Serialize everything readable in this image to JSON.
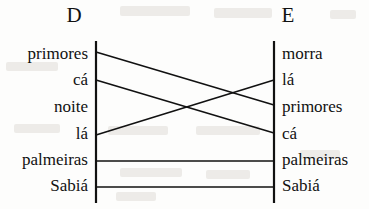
{
  "diagram": {
    "type": "bipartite-alignment",
    "column_headers": {
      "left": "D",
      "right": "E"
    },
    "left_items": [
      {
        "label": "primores",
        "y": 57
      },
      {
        "label": "cá",
        "y": 83
      },
      {
        "label": "noite",
        "y": 110
      },
      {
        "label": "lá",
        "y": 137
      },
      {
        "label": "palmeiras",
        "y": 163
      },
      {
        "label": "Sabiá",
        "y": 189
      }
    ],
    "right_items": [
      {
        "label": "morra",
        "y": 57
      },
      {
        "label": "lá",
        "y": 83
      },
      {
        "label": "primores",
        "y": 110
      },
      {
        "label": "cá",
        "y": 137
      },
      {
        "label": "palmeiras",
        "y": 163
      },
      {
        "label": "Sabiá",
        "y": 189
      }
    ],
    "connections": [
      {
        "from": "primores",
        "to": "primores",
        "y1": 52,
        "y2": 105
      },
      {
        "from": "cá",
        "to": "cá",
        "y1": 80,
        "y2": 133
      },
      {
        "from": "lá",
        "to": "lá",
        "y1": 135,
        "y2": 80
      },
      {
        "from": "palmeiras",
        "to": "palmeiras",
        "y1": 161,
        "y2": 161
      },
      {
        "from": "Sabiá",
        "to": "Sabiá",
        "y1": 187,
        "y2": 187
      }
    ],
    "axes": {
      "left_x": 96,
      "right_x": 274,
      "top_y": 41,
      "bottom_y": 203
    },
    "colors": {
      "ink": "#111111",
      "paper": "#fdfdfc",
      "bleed": "#c9c4ba"
    }
  }
}
